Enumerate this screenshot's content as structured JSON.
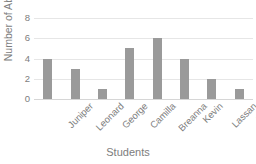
{
  "chart_data": {
    "type": "bar",
    "title": "",
    "categories": [
      "Juniper",
      "Leonard",
      "George",
      "Camilla",
      "Breanna",
      "Kevin",
      "Lassan",
      "Peter"
    ],
    "values": [
      4,
      3,
      1,
      5,
      6,
      4,
      2,
      1
    ],
    "xlabel": "Students",
    "ylabel": "Number of Absences",
    "ylim": [
      0,
      8
    ],
    "yticks": [
      0,
      2,
      4,
      6,
      8
    ],
    "grid": true,
    "legend": "none",
    "bar_color": "#9a9a9a",
    "gridline_color": "#e6e6e6",
    "text_color": "#7d7d7d"
  }
}
